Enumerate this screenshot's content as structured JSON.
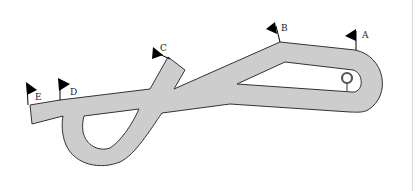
{
  "diagram": {
    "type": "track-layout",
    "colors": {
      "track_fill": "#cdcdcd",
      "track_outline": "#333333",
      "flag": "#000000",
      "background": "#ffffff",
      "marker": "#555555"
    },
    "flags": [
      {
        "id": "A",
        "label": "A"
      },
      {
        "id": "B",
        "label": "B"
      },
      {
        "id": "C",
        "label": "C"
      },
      {
        "id": "D",
        "label": "D"
      },
      {
        "id": "E",
        "label": "E"
      }
    ],
    "marker": {
      "name": "ring-post"
    }
  }
}
